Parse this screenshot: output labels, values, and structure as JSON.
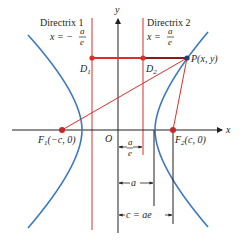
{
  "colors": {
    "hyperbola": "#3a78c4",
    "red": "#d9302a",
    "axis": "#231f20",
    "dark_red": "#8b1a1a"
  },
  "axes": {
    "x_label": "x",
    "y_label": "y",
    "origin_label": "O"
  },
  "directrix1": {
    "title": "Directrix 1",
    "eq_lhs": "x = −",
    "eq_num": "a",
    "eq_den": "e",
    "point_label": "D",
    "point_sub": "1"
  },
  "directrix2": {
    "title": "Directrix 2",
    "eq_lhs": "x =",
    "eq_num": "a",
    "eq_den": "e",
    "point_label": "D",
    "point_sub": "2"
  },
  "point_p": {
    "label": "P(x, y)"
  },
  "focus1": {
    "name": "F",
    "sub": "1",
    "coords": "(−c, 0)"
  },
  "focus2": {
    "name": "F",
    "sub": "2",
    "coords": "(c, 0)"
  },
  "dimensions": {
    "a_over_e_num": "a",
    "a_over_e_den": "e",
    "a": "a",
    "c": "c = ae"
  }
}
